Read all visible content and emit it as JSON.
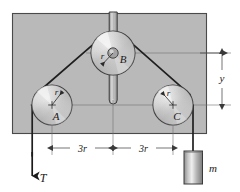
{
  "figure": {
    "type": "engineering-mechanics-pulley-diagram",
    "background_color": "#ffffff",
    "panel_color": "#b9b9b9",
    "panel_border_color": "#4a4a4a",
    "line_color": "#2a2a2a",
    "thin_line_color": "#6e6e6e",
    "pulleys": [
      {
        "id": "A",
        "label": "A",
        "radius_label": "r",
        "cx": 52,
        "cy": 105,
        "r": 20
      },
      {
        "id": "B",
        "label": "B",
        "radius_label": "r",
        "cx": 113,
        "cy": 53,
        "r": 22
      },
      {
        "id": "C",
        "label": "C",
        "radius_label": "r",
        "cx": 173,
        "cy": 105,
        "r": 20
      }
    ],
    "dimensions": [
      {
        "name": "span-left",
        "label": "3r"
      },
      {
        "name": "span-right",
        "label": "3r"
      },
      {
        "name": "height",
        "label": "y"
      }
    ],
    "force": {
      "name": "tension",
      "label": "T",
      "direction": "down"
    },
    "mass": {
      "name": "hanging-mass",
      "label": "m"
    }
  }
}
